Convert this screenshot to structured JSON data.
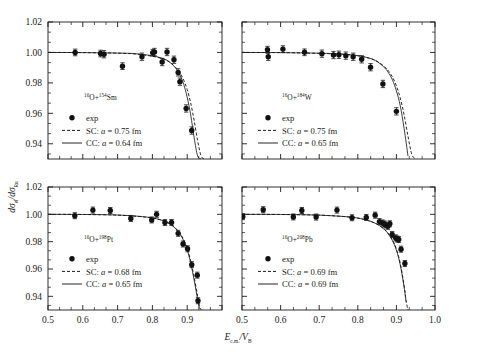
{
  "figure": {
    "axis_titles": {
      "y": "dσel/dσRu",
      "y_main": "dσ",
      "y_sub1": "el",
      "y_mid": "/dσ",
      "y_sub2": "Ru",
      "x_main": "E",
      "x_sub1": "c.m.",
      "x_mid": "/V",
      "x_sub2": "B"
    },
    "x_axis": {
      "min": 0.5,
      "max": 1.0,
      "ticks": [
        0.5,
        0.6,
        0.7,
        0.8,
        0.9,
        1.0
      ],
      "tick_labels": [
        "0.5",
        "0.6",
        "0.7",
        "0.8",
        "0.9",
        "1.0"
      ],
      "minor_per_interval": 2
    },
    "y_axis_top": {
      "min": 0.93,
      "max": 1.02,
      "ticks": [
        0.94,
        0.96,
        0.98,
        1.0,
        1.02
      ],
      "tick_labels": [
        "0.94",
        "0.96",
        "0.98",
        "1.00",
        "1.02"
      ],
      "minor_per_interval": 2
    },
    "y_axis_bottom": {
      "min": 0.93,
      "max": 1.02,
      "ticks": [
        0.94,
        0.96,
        0.98,
        1.0,
        1.02
      ],
      "tick_labels": [
        "0.94",
        "0.96",
        "0.98",
        "1.00",
        "1.02"
      ],
      "minor_per_interval": 2
    },
    "legend_common": {
      "exp_label": "exp",
      "sc_prefix": "SC: ",
      "cc_prefix": "CC: ",
      "a_symbol": "a",
      "eq": " = ",
      "unit": " fm"
    }
  },
  "chart_data": [
    {
      "type": "scatter",
      "panel": "top-left",
      "title": "16O+154Sm",
      "projectile_mass": "16",
      "projectile": "O",
      "target_mass": "154",
      "target": "Sm",
      "xlabel": "E_c.m./V_B",
      "ylabel": "dsigma_el/dsigma_Ru",
      "xlim": [
        0.5,
        1.0
      ],
      "ylim": [
        0.93,
        1.02
      ],
      "legend": {
        "exp": "exp",
        "sc": "SC: a = 0.75 fm",
        "sc_a": 0.75,
        "cc": "CC: a = 0.64 fm",
        "cc_a": 0.64
      },
      "series": [
        {
          "name": "exp",
          "marker": "filled-circle",
          "x": [
            0.578,
            0.651,
            0.661,
            0.714,
            0.77,
            0.801,
            0.806,
            0.828,
            0.842,
            0.862,
            0.874,
            0.879,
            0.897,
            0.913
          ],
          "y": [
            1.0,
            0.9993,
            0.9988,
            0.991,
            0.9972,
            0.9998,
            1.0003,
            0.9937,
            1.0003,
            0.9952,
            0.9869,
            0.9808,
            0.9632,
            0.9487
          ],
          "yerr": [
            0.0022,
            0.0022,
            0.0024,
            0.0022,
            0.0024,
            0.0022,
            0.0024,
            0.0024,
            0.0024,
            0.0024,
            0.0024,
            0.0024,
            0.0024,
            0.0024
          ]
        },
        {
          "name": "SC: a = 0.75 fm",
          "style": "dashed",
          "x": [
            0.5,
            0.6,
            0.7,
            0.75,
            0.8,
            0.83,
            0.85,
            0.87,
            0.88,
            0.89,
            0.9,
            0.91,
            0.92,
            0.93,
            0.94,
            0.95
          ],
          "y": [
            1.0,
            0.9999,
            0.9995,
            0.999,
            0.9975,
            0.9958,
            0.9936,
            0.9894,
            0.9862,
            0.9818,
            0.9756,
            0.9668,
            0.9552,
            0.942,
            0.932,
            0.93
          ]
        },
        {
          "name": "CC: a = 0.64 fm",
          "style": "solid",
          "x": [
            0.5,
            0.6,
            0.7,
            0.75,
            0.8,
            0.83,
            0.85,
            0.87,
            0.88,
            0.89,
            0.9,
            0.91,
            0.92,
            0.93,
            0.94
          ],
          "y": [
            1.0,
            0.9999,
            0.9996,
            0.9992,
            0.9978,
            0.996,
            0.9936,
            0.9888,
            0.9848,
            0.979,
            0.9706,
            0.959,
            0.944,
            0.932,
            0.93
          ]
        }
      ]
    },
    {
      "type": "scatter",
      "panel": "top-right",
      "title": "16O+184W",
      "projectile_mass": "16",
      "projectile": "O",
      "target_mass": "184",
      "target": "W",
      "xlabel": "E_c.m./V_B",
      "ylabel": "dsigma_el/dsigma_Ru",
      "xlim": [
        0.5,
        1.0
      ],
      "ylim": [
        0.93,
        1.02
      ],
      "legend": {
        "exp": "exp",
        "sc": "SC: a = 0.75 fm",
        "sc_a": 0.75,
        "cc": "CC: a = 0.65 fm",
        "cc_a": 0.65
      },
      "series": [
        {
          "name": "exp",
          "marker": "filled-circle",
          "x": [
            0.566,
            0.568,
            0.606,
            0.662,
            0.707,
            0.737,
            0.751,
            0.769,
            0.788,
            0.81,
            0.833,
            0.865,
            0.9
          ],
          "y": [
            1.0018,
            0.9972,
            1.0022,
            1.0001,
            0.9992,
            0.9983,
            0.9985,
            0.9979,
            0.9972,
            0.9955,
            0.9903,
            0.9793,
            0.9613
          ],
          "yerr": [
            0.0022,
            0.0024,
            0.0022,
            0.0022,
            0.0024,
            0.0024,
            0.0024,
            0.0024,
            0.0024,
            0.0024,
            0.0024,
            0.0024,
            0.0024
          ]
        },
        {
          "name": "SC: a = 0.75 fm",
          "style": "dashed",
          "x": [
            0.5,
            0.6,
            0.7,
            0.76,
            0.8,
            0.83,
            0.85,
            0.87,
            0.88,
            0.89,
            0.9,
            0.91,
            0.92,
            0.93,
            0.94,
            0.95
          ],
          "y": [
            1.0,
            0.9999,
            0.9994,
            0.9988,
            0.9978,
            0.9962,
            0.9942,
            0.9905,
            0.9876,
            0.9838,
            0.978,
            0.97,
            0.959,
            0.945,
            0.933,
            0.93
          ]
        },
        {
          "name": "CC: a = 0.65 fm",
          "style": "solid",
          "x": [
            0.5,
            0.6,
            0.7,
            0.76,
            0.8,
            0.83,
            0.85,
            0.87,
            0.88,
            0.89,
            0.9,
            0.91,
            0.92,
            0.93
          ],
          "y": [
            1.0,
            0.9999,
            0.9995,
            0.9989,
            0.9979,
            0.9962,
            0.994,
            0.9898,
            0.9864,
            0.9818,
            0.9748,
            0.965,
            0.95,
            0.932
          ]
        }
      ]
    },
    {
      "type": "scatter",
      "panel": "bottom-left",
      "title": "16O+198Pt",
      "projectile_mass": "16",
      "projectile": "O",
      "target_mass": "198",
      "target": "Pt",
      "xlabel": "E_c.m./V_B",
      "ylabel": "dsigma_el/dsigma_Ru",
      "xlim": [
        0.5,
        1.0
      ],
      "ylim": [
        0.93,
        1.02
      ],
      "legend": {
        "exp": "exp",
        "sc": "SC: a = 0.68 fm",
        "sc_a": 0.68,
        "cc": "CC: a = 0.65 fm",
        "cc_a": 0.65
      },
      "series": [
        {
          "name": "exp",
          "marker": "filled-circle",
          "x": [
            0.577,
            0.629,
            0.679,
            0.738,
            0.798,
            0.812,
            0.836,
            0.855,
            0.874,
            0.888,
            0.901,
            0.913,
            0.929,
            0.931
          ],
          "y": [
            0.999,
            1.0031,
            1.0028,
            0.997,
            0.9959,
            1.0,
            0.994,
            0.994,
            0.9861,
            0.9783,
            0.9748,
            0.9632,
            0.9555,
            0.9368
          ],
          "yerr": [
            0.0022,
            0.0022,
            0.0022,
            0.0022,
            0.0022,
            0.0022,
            0.0022,
            0.0022,
            0.0022,
            0.0022,
            0.0022,
            0.0022,
            0.0022,
            0.0022
          ]
        },
        {
          "name": "SC: a = 0.68 fm",
          "style": "dashed",
          "x": [
            0.5,
            0.6,
            0.7,
            0.78,
            0.82,
            0.85,
            0.87,
            0.88,
            0.89,
            0.9,
            0.91,
            0.92,
            0.93,
            0.935,
            0.94
          ],
          "y": [
            1.0,
            0.9999,
            0.9994,
            0.998,
            0.9962,
            0.9932,
            0.989,
            0.9858,
            0.9815,
            0.9752,
            0.966,
            0.954,
            0.94,
            0.933,
            0.93
          ]
        },
        {
          "name": "CC: a = 0.65 fm",
          "style": "solid",
          "x": [
            0.5,
            0.6,
            0.7,
            0.78,
            0.82,
            0.85,
            0.87,
            0.88,
            0.89,
            0.9,
            0.91,
            0.92,
            0.93,
            0.935
          ],
          "y": [
            1.0,
            0.9999,
            0.9995,
            0.9981,
            0.9962,
            0.993,
            0.9886,
            0.9852,
            0.9806,
            0.974,
            0.9644,
            0.9518,
            0.9375,
            0.931
          ]
        }
      ]
    },
    {
      "type": "scatter",
      "panel": "bottom-right",
      "title": "16O+208Pb",
      "projectile_mass": "16",
      "projectile": "O",
      "target_mass": "208",
      "target": "Pb",
      "xlabel": "E_c.m./V_B",
      "ylabel": "dsigma_el/dsigma_Ru",
      "xlim": [
        0.5,
        1.0
      ],
      "ylim": [
        0.93,
        1.02
      ],
      "legend": {
        "exp": "exp",
        "sc": "SC: a = 0.69 fm",
        "sc_a": 0.69,
        "cc": "CC: a = 0.69 fm",
        "cc_a": 0.69
      },
      "series": [
        {
          "name": "exp",
          "marker": "filled-circle",
          "x": [
            0.502,
            0.555,
            0.633,
            0.655,
            0.692,
            0.746,
            0.785,
            0.822,
            0.845,
            0.856,
            0.864,
            0.869,
            0.872,
            0.878,
            0.883,
            0.889,
            0.898,
            0.902,
            0.906,
            0.912,
            0.922
          ],
          "y": [
            0.9983,
            1.0034,
            0.9981,
            1.0028,
            0.998,
            1.0031,
            0.9975,
            0.9977,
            0.9994,
            0.9947,
            0.9937,
            0.993,
            0.9922,
            0.9912,
            0.9931,
            0.9852,
            0.9828,
            0.982,
            0.9816,
            0.9745,
            0.964
          ],
          "yerr": [
            0.0022,
            0.0022,
            0.0022,
            0.0022,
            0.0022,
            0.0022,
            0.0022,
            0.0022,
            0.0022,
            0.0022,
            0.0022,
            0.0022,
            0.0022,
            0.0022,
            0.0022,
            0.0022,
            0.0022,
            0.0022,
            0.0022,
            0.0022,
            0.0022
          ]
        },
        {
          "name": "SC: a = 0.69 fm",
          "style": "dashed",
          "x": [
            0.5,
            0.6,
            0.7,
            0.78,
            0.82,
            0.85,
            0.87,
            0.88,
            0.89,
            0.9,
            0.91,
            0.92,
            0.925,
            0.93
          ],
          "y": [
            1.0,
            0.9999,
            0.9994,
            0.998,
            0.996,
            0.9928,
            0.9888,
            0.9856,
            0.9812,
            0.9746,
            0.964,
            0.948,
            0.937,
            0.93
          ]
        },
        {
          "name": "CC: a = 0.69 fm",
          "style": "solid",
          "x": [
            0.5,
            0.6,
            0.7,
            0.78,
            0.82,
            0.85,
            0.87,
            0.88,
            0.89,
            0.9,
            0.91,
            0.92,
            0.925
          ],
          "y": [
            1.0,
            0.9999,
            0.9994,
            0.998,
            0.996,
            0.9928,
            0.9886,
            0.9852,
            0.9806,
            0.9738,
            0.963,
            0.9468,
            0.936
          ]
        }
      ]
    }
  ]
}
